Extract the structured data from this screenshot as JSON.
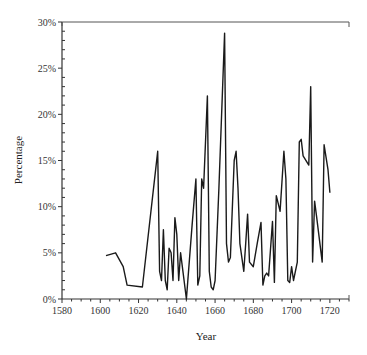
{
  "chart_data": {
    "type": "line",
    "title": "",
    "xlabel": "Year",
    "ylabel": "Percentage",
    "xlim": [
      1580,
      1730
    ],
    "ylim": [
      0,
      30
    ],
    "grid": false,
    "legend": null,
    "x_ticks": [
      1580,
      1600,
      1620,
      1640,
      1660,
      1680,
      1700,
      1720
    ],
    "y_ticks": [
      "0%",
      "5%",
      "10%",
      "15%",
      "20%",
      "25%",
      "30%"
    ],
    "series": [
      {
        "name": "Percentage",
        "color": "#1a1a1a",
        "x": [
          1603,
          1608,
          1612,
          1614,
          1622,
          1630,
          1631,
          1632,
          1633,
          1634,
          1635,
          1636,
          1637,
          1638,
          1639,
          1640,
          1641,
          1642,
          1645,
          1648,
          1650,
          1651,
          1652,
          1653,
          1654,
          1656,
          1657,
          1658,
          1659,
          1660,
          1662,
          1665,
          1666,
          1667,
          1668,
          1670,
          1671,
          1672,
          1673,
          1675,
          1676,
          1677,
          1678,
          1680,
          1682,
          1684,
          1685,
          1686,
          1687,
          1688,
          1690,
          1691,
          1692,
          1694,
          1696,
          1697,
          1698,
          1699,
          1700,
          1701,
          1703,
          1704,
          1705,
          1706,
          1709,
          1710,
          1711,
          1712,
          1713,
          1716,
          1717,
          1719,
          1720
        ],
        "values": [
          4.7,
          5.0,
          3.5,
          1.5,
          1.3,
          16.0,
          3.0,
          2.0,
          7.5,
          2.0,
          1.0,
          5.5,
          5.0,
          2.0,
          8.8,
          7.0,
          2.0,
          5.0,
          0.0,
          8.0,
          13.0,
          1.5,
          2.5,
          13.0,
          12.0,
          22.0,
          3.0,
          1.3,
          1.0,
          2.0,
          12.0,
          28.8,
          6.0,
          4.0,
          4.5,
          15.0,
          16.0,
          12.0,
          6.0,
          3.0,
          6.0,
          9.2,
          4.0,
          3.5,
          6.0,
          8.3,
          1.5,
          2.5,
          2.8,
          2.5,
          8.4,
          1.8,
          11.2,
          9.5,
          16.0,
          13.0,
          2.0,
          1.8,
          3.5,
          2.0,
          4.0,
          17.0,
          17.3,
          15.5,
          14.5,
          23.0,
          4.0,
          10.6,
          9.0,
          4.0,
          16.7,
          14.0,
          11.5
        ]
      }
    ]
  }
}
